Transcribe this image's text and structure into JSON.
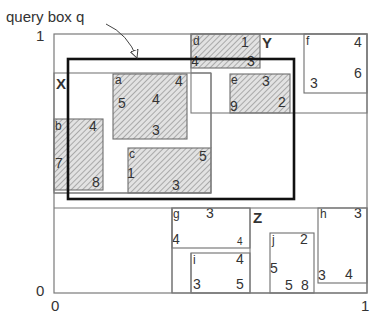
{
  "annotation": {
    "label": "query box q"
  },
  "axes": {
    "y_top": "1",
    "y_bottom": "0",
    "x_left": "0",
    "x_right": "1"
  },
  "regions": [
    {
      "name": "X",
      "x": 54,
      "y": 73,
      "w": 157,
      "h": 120
    },
    {
      "name": "Y",
      "x": 191,
      "y": 34,
      "w": 176,
      "h": 79
    },
    {
      "name": "Z",
      "x": 172,
      "y": 208,
      "w": 195,
      "h": 85
    }
  ],
  "boxes": [
    {
      "id": "a",
      "shaded": true,
      "x": 113,
      "y": 74,
      "w": 74,
      "h": 65,
      "labels": [
        {
          "t": "a",
          "x": 115,
          "y": 84,
          "s": 12
        },
        {
          "t": "4",
          "x": 175,
          "y": 86,
          "s": 14
        },
        {
          "t": "5",
          "x": 118,
          "y": 108,
          "s": 14
        },
        {
          "t": "4",
          "x": 152,
          "y": 104,
          "s": 14
        },
        {
          "t": "3",
          "x": 152,
          "y": 135,
          "s": 14
        }
      ]
    },
    {
      "id": "b",
      "shaded": true,
      "x": 54,
      "y": 119,
      "w": 49,
      "h": 71,
      "labels": [
        {
          "t": "b",
          "x": 55,
          "y": 130,
          "s": 12
        },
        {
          "t": "4",
          "x": 89,
          "y": 131,
          "s": 14
        },
        {
          "t": "7",
          "x": 55,
          "y": 168,
          "s": 14
        },
        {
          "t": "8",
          "x": 92,
          "y": 187,
          "s": 14
        }
      ]
    },
    {
      "id": "c",
      "shaded": true,
      "x": 128,
      "y": 148,
      "w": 83,
      "h": 45,
      "labels": [
        {
          "t": "c",
          "x": 129,
          "y": 158,
          "s": 12
        },
        {
          "t": "5",
          "x": 199,
          "y": 161,
          "s": 14
        },
        {
          "t": "1",
          "x": 127,
          "y": 178,
          "s": 14
        },
        {
          "t": "3",
          "x": 172,
          "y": 190,
          "s": 14
        }
      ]
    },
    {
      "id": "d",
      "shaded": true,
      "x": 191,
      "y": 34,
      "w": 69,
      "h": 34,
      "labels": [
        {
          "t": "d",
          "x": 193,
          "y": 45,
          "s": 12
        },
        {
          "t": "1",
          "x": 241,
          "y": 47,
          "s": 14
        },
        {
          "t": "4",
          "x": 191,
          "y": 66,
          "s": 14
        },
        {
          "t": "3",
          "x": 247,
          "y": 66,
          "s": 14
        }
      ]
    },
    {
      "id": "e",
      "shaded": true,
      "x": 230,
      "y": 74,
      "w": 60,
      "h": 39,
      "labels": [
        {
          "t": "e",
          "x": 231,
          "y": 84,
          "s": 12
        },
        {
          "t": "3",
          "x": 262,
          "y": 86,
          "s": 14
        },
        {
          "t": "9",
          "x": 230,
          "y": 111,
          "s": 14
        },
        {
          "t": "2",
          "x": 278,
          "y": 107,
          "s": 14
        }
      ]
    },
    {
      "id": "f",
      "shaded": false,
      "x": 304,
      "y": 34,
      "w": 63,
      "h": 59,
      "labels": [
        {
          "t": "f",
          "x": 306,
          "y": 45,
          "s": 12
        },
        {
          "t": "4",
          "x": 354,
          "y": 47,
          "s": 14
        },
        {
          "t": "6",
          "x": 354,
          "y": 78,
          "s": 14
        },
        {
          "t": "3",
          "x": 310,
          "y": 88,
          "s": 14
        }
      ]
    },
    {
      "id": "g",
      "shaded": false,
      "x": 172,
      "y": 208,
      "w": 78,
      "h": 40,
      "labels": [
        {
          "t": "g",
          "x": 173,
          "y": 218,
          "s": 12
        },
        {
          "t": "3",
          "x": 206,
          "y": 218,
          "s": 14
        },
        {
          "t": "4",
          "x": 172,
          "y": 244,
          "s": 14
        },
        {
          "t": "4",
          "x": 237,
          "y": 245,
          "s": 10
        }
      ]
    },
    {
      "id": "h",
      "shaded": false,
      "x": 318,
      "y": 208,
      "w": 49,
      "h": 75,
      "labels": [
        {
          "t": "h",
          "x": 320,
          "y": 218,
          "s": 12
        },
        {
          "t": "3",
          "x": 354,
          "y": 218,
          "s": 14
        },
        {
          "t": "3",
          "x": 318,
          "y": 280,
          "s": 14
        },
        {
          "t": "4",
          "x": 345,
          "y": 279,
          "s": 14
        }
      ]
    },
    {
      "id": "i",
      "shaded": false,
      "x": 191,
      "y": 253,
      "w": 59,
      "h": 40,
      "labels": [
        {
          "t": "i",
          "x": 193,
          "y": 264,
          "s": 12
        },
        {
          "t": "4",
          "x": 236,
          "y": 264,
          "s": 14
        },
        {
          "t": "3",
          "x": 193,
          "y": 289,
          "s": 14
        },
        {
          "t": "5",
          "x": 236,
          "y": 289,
          "s": 14
        }
      ]
    },
    {
      "id": "j",
      "shaded": false,
      "x": 270,
      "y": 233,
      "w": 44,
      "h": 60,
      "labels": [
        {
          "t": "j",
          "x": 272,
          "y": 244,
          "s": 12
        },
        {
          "t": "2",
          "x": 300,
          "y": 244,
          "s": 14
        },
        {
          "t": "5",
          "x": 270,
          "y": 273,
          "s": 14
        },
        {
          "t": "5",
          "x": 285,
          "y": 290,
          "s": 14
        },
        {
          "t": "8",
          "x": 301,
          "y": 290,
          "s": 14
        }
      ]
    }
  ],
  "query_box": {
    "x": 68,
    "y": 59,
    "w": 226,
    "h": 140
  },
  "outer_box": {
    "x": 54,
    "y": 34,
    "w": 313,
    "h": 259
  },
  "colors": {
    "line": "#7a7a7a",
    "query": "#111111",
    "hatch": "#8a8a8a",
    "hatch_bg": "#d8d8d8"
  }
}
